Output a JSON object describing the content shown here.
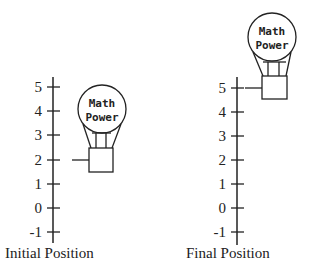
{
  "diagram": {
    "type": "number-line-comparison",
    "panels": [
      {
        "caption": "Initial Position",
        "axis_labels": [
          "5",
          "4",
          "3",
          "2",
          "1",
          "0",
          "-1"
        ],
        "balloon": {
          "line1": "Math",
          "line2": "Power"
        },
        "pointer_value": 2
      },
      {
        "caption": "Final Position",
        "axis_labels": [
          "5",
          "4",
          "3",
          "2",
          "1",
          "0",
          "-1"
        ],
        "balloon": {
          "line1": "Math",
          "line2": "Power"
        },
        "pointer_value": 5
      }
    ],
    "colors": {
      "stroke": "#222222",
      "background": "#ffffff"
    }
  }
}
